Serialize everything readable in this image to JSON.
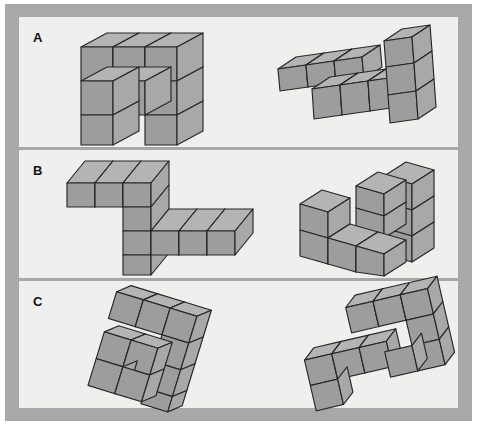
{
  "figure": {
    "type": "mental-rotation-task",
    "background_color": "#ffffff",
    "frame_color": "#a8a8a8",
    "panel_color": "#efefed",
    "cube_stroke_color": "#262626",
    "cube_face_colors": {
      "top": "#b4b4b4",
      "left": "#9d9d9d",
      "right": "#a8a8a8"
    },
    "rows": [
      {
        "label": "A",
        "left_figure_name": "cube-figure-a-left",
        "right_figure_name": "cube-figure-a-right",
        "cube_count": 10
      },
      {
        "label": "B",
        "left_figure_name": "cube-figure-b-left",
        "right_figure_name": "cube-figure-b-right",
        "cube_count": 10
      },
      {
        "label": "C",
        "left_figure_name": "cube-figure-c-left",
        "right_figure_name": "cube-figure-c-right",
        "cube_count": 10
      }
    ]
  }
}
